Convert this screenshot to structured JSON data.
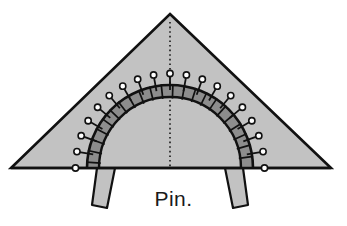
{
  "figure": {
    "caption": "Pin.",
    "title": "Pin.",
    "colors": {
      "background": "#ffffff",
      "fabric_fill": "#c2c2c2",
      "band_fill": "#8d8d8d",
      "outline": "#111111",
      "fold_line": "#2b2b2b",
      "tab_fill": "#c2c2c2",
      "pin_head_fill": "#ffffff",
      "caption_color": "#1a1a1a"
    },
    "geometry": {
      "triangle": {
        "apex": [
          170,
          14
        ],
        "bottom_left": [
          11,
          168
        ],
        "bottom_right": [
          331,
          168
        ]
      },
      "arch": {
        "center": [
          170,
          168
        ],
        "outer_radius": 83,
        "inner_radius": 71,
        "start_angle_deg": 180,
        "end_angle_deg": 0
      },
      "fold_line": {
        "from": [
          170,
          22
        ],
        "to": [
          170,
          168
        ],
        "style": "dotted"
      },
      "tabs": [
        {
          "name": "left-tab",
          "points": "97,168 115,168 107,208 92,205"
        },
        {
          "name": "right-tab",
          "points": "225,168 243,168 248,205 233,208"
        }
      ]
    },
    "pins": {
      "count": 19,
      "head_radius": 3.1,
      "shaft_length": 9,
      "angles_deg": [
        180,
        170,
        160,
        150,
        140,
        130,
        120,
        110,
        100,
        90,
        80,
        70,
        60,
        50,
        40,
        30,
        20,
        10,
        0
      ]
    },
    "ticks": {
      "count": 22,
      "angles_deg": [
        176,
        168,
        160,
        152,
        144,
        136,
        128,
        120,
        112,
        104,
        96,
        88,
        80,
        72,
        64,
        56,
        48,
        40,
        32,
        24,
        16,
        8
      ]
    }
  }
}
